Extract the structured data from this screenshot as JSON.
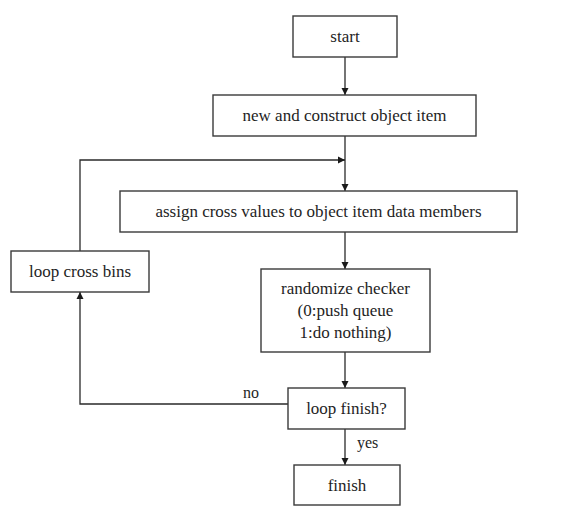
{
  "diagram": {
    "type": "flowchart",
    "nodes": {
      "start": {
        "label": "start"
      },
      "construct": {
        "label": "new and construct object item"
      },
      "assign": {
        "label": "assign cross values to object item data members"
      },
      "loop_bins": {
        "label": "loop cross bins"
      },
      "randomize": {
        "lines": [
          "randomize checker",
          "(0:push queue",
          "1:do nothing)"
        ]
      },
      "loop_finish": {
        "label": "loop finish?"
      },
      "finish": {
        "label": "finish"
      }
    },
    "edges": [
      {
        "from": "start",
        "to": "construct",
        "label": ""
      },
      {
        "from": "construct",
        "to": "assign",
        "label": ""
      },
      {
        "from": "assign",
        "to": "randomize",
        "label": ""
      },
      {
        "from": "randomize",
        "to": "loop_finish",
        "label": ""
      },
      {
        "from": "loop_finish",
        "to": "finish",
        "label": "yes"
      },
      {
        "from": "loop_finish",
        "to": "loop_bins",
        "label": "no"
      },
      {
        "from": "loop_bins",
        "to": "assign",
        "label": ""
      }
    ],
    "edge_labels": {
      "yes": "yes",
      "no": "no"
    },
    "colors": {
      "stroke": "#3a3a3a",
      "text": "#1e1e1e",
      "background": "#ffffff"
    }
  }
}
